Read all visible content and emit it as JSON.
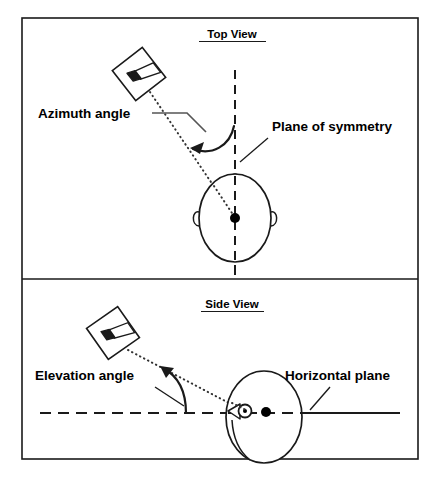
{
  "figure": {
    "name": "spatial-audio-angle-definition-diagram",
    "background_color": "#ffffff",
    "line_color": "#1a1a1a",
    "frame": {
      "x": 22,
      "y": 18,
      "width": 396,
      "height": 441,
      "divider_y": 279
    },
    "panels": [
      {
        "id": "top-view",
        "title": "Top View",
        "title_underlined": true,
        "title_x": 232,
        "title_y": 38,
        "elements": {
          "plane_of_symmetry_line": {
            "style": "dashed",
            "x": 235,
            "y1": 70,
            "y2": 276
          },
          "head": {
            "center_x": 235,
            "center_y": 218,
            "rx": 36,
            "ry": 44,
            "nose": "top",
            "ears": "left-right",
            "center_dot": true
          },
          "loudspeaker": {
            "center_x": 139,
            "center_y": 74,
            "size": 38,
            "rotation_deg": -38
          },
          "ray": {
            "style": "dotted",
            "from_x": 148,
            "from_y": 90,
            "to_x": 235,
            "to_y": 218
          },
          "angle_arc": {
            "label": "azimuth",
            "arrow_direction": "counterclockwise"
          }
        },
        "labels": [
          {
            "name": "azimuth-angle-label",
            "text": "Azimuth angle",
            "x": 38,
            "y": 113,
            "anchor": "start",
            "leader": true
          },
          {
            "name": "plane-of-symmetry-label",
            "text": "Plane of symmetry",
            "x": 272,
            "y": 132,
            "anchor": "start",
            "leader": true
          }
        ]
      },
      {
        "id": "side-view",
        "title": "Side View",
        "title_underlined": true,
        "title_x": 232,
        "title_y": 308,
        "elements": {
          "horizontal_plane_line": {
            "style": "dashed",
            "y": 413,
            "x1": 40,
            "x2": 400
          },
          "head": {
            "center_x": 262,
            "center_y": 416,
            "rx": 39,
            "ry": 46,
            "nose": "left",
            "ear": true,
            "center_dot": true
          },
          "loudspeaker": {
            "center_x": 113,
            "center_y": 333,
            "size": 38,
            "rotation_deg": -35
          },
          "ray": {
            "style": "dotted",
            "from_x": 127,
            "from_y": 349,
            "to_x": 243,
            "to_y": 413
          },
          "angle_arc": {
            "label": "elevation",
            "arrow_direction": "upward"
          }
        },
        "labels": [
          {
            "name": "elevation-angle-label",
            "text": "Elevation angle",
            "x": 35,
            "y": 375,
            "anchor": "start",
            "leader": true
          },
          {
            "name": "horizontal-plane-label",
            "text": "Horizontal plane",
            "x": 285,
            "y": 375,
            "anchor": "start",
            "leader": true
          }
        ]
      }
    ]
  }
}
